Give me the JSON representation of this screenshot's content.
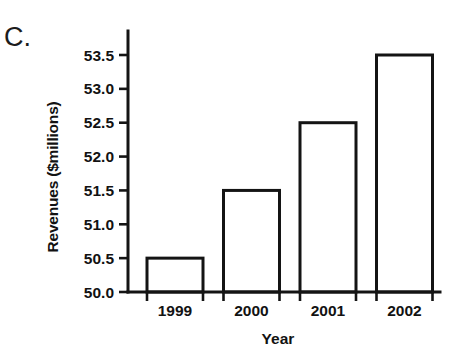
{
  "panel": {
    "letter": "C."
  },
  "chart_data": {
    "type": "bar",
    "title": "",
    "subtitle": "",
    "xlabel": "Year",
    "ylabel": "Revenues ($millions)",
    "categories": [
      "1999",
      "2000",
      "2001",
      "2002"
    ],
    "values": [
      50.5,
      51.5,
      52.5,
      53.5
    ],
    "series": [
      {
        "name": "Revenues",
        "values": [
          50.5,
          51.5,
          52.5,
          53.5
        ]
      }
    ],
    "ylim": [
      50.0,
      53.75
    ],
    "ytick_labels": [
      "50.0",
      "50.5",
      "51.0",
      "51.5",
      "52.0",
      "52.5",
      "53.0",
      "53.5"
    ],
    "ytick_values": [
      50.0,
      50.5,
      51.0,
      51.5,
      52.0,
      52.5,
      53.0,
      53.5
    ],
    "xtick_labels": [
      "1999",
      "2000",
      "2001",
      "2002"
    ],
    "grid": false,
    "legend": false,
    "legend_position": "none",
    "bar_fill_color": "#ffffff",
    "bar_edge_color": "#141414",
    "axis_color": "#141414",
    "background_color": "#ffffff",
    "annotations": []
  }
}
